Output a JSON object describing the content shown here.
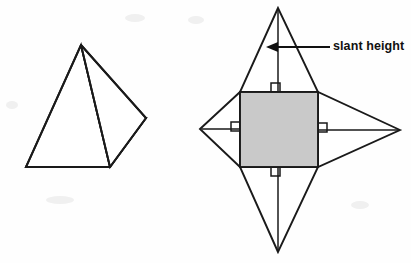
{
  "figure": {
    "background_color": "#fefefe",
    "line_color": "#1a1a1a",
    "shaded_face_color": "#c9c9c9",
    "annotations": [
      {
        "id": "slant-height",
        "label": "slant height",
        "points_to": "perpendicular segment from apex of top triangle to base of that triangle",
        "arrow_direction": "left"
      }
    ],
    "solid": {
      "name": "square pyramid",
      "apex": {
        "x": 81,
        "y": 45
      },
      "base_vertices": [
        {
          "name": "front",
          "x": 110,
          "y": 167
        },
        {
          "name": "left",
          "x": 26,
          "y": 167
        },
        {
          "name": "back-hidden",
          "x": 53,
          "y": 118
        },
        {
          "name": "right",
          "x": 146,
          "y": 118
        }
      ],
      "hidden_edges_style": "dashed",
      "shaded_base": true
    },
    "net": {
      "name": "net of square pyramid",
      "square": {
        "x": 240,
        "y": 92,
        "width": 78,
        "height": 75,
        "fill": "#c9c9c9"
      },
      "triangle_apexes": [
        {
          "name": "top",
          "x": 278,
          "y": 8
        },
        {
          "name": "bottom",
          "x": 278,
          "y": 252
        },
        {
          "name": "left",
          "x": 200,
          "y": 129
        },
        {
          "name": "right",
          "x": 400,
          "y": 130
        }
      ],
      "right_angle_markers": 4,
      "slant_height_segments": 4
    }
  },
  "callout": {
    "slant_height_label": "slant height",
    "text_x": 333,
    "text_y": 47
  }
}
